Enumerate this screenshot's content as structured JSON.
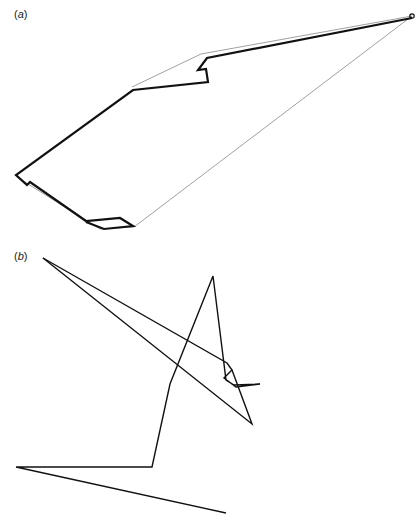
{
  "panels": [
    {
      "id": "a",
      "label_open": "(",
      "label_letter": "a",
      "label_close": ")",
      "thin_path_color": "#888888",
      "thick_path_color": "#111111",
      "thin_path": [
        [
          132,
          87
        ],
        [
          201,
          54
        ],
        [
          412,
          16
        ],
        [
          134,
          227
        ],
        [
          100,
          229
        ],
        [
          28,
          184
        ],
        [
          16,
          176
        ]
      ],
      "thick_path": [
        [
          412,
          18
        ],
        [
          207,
          58
        ],
        [
          198,
          70
        ],
        [
          206,
          69
        ],
        [
          208,
          82
        ],
        [
          133,
          90
        ],
        [
          16,
          175
        ],
        [
          27,
          185
        ],
        [
          30,
          182
        ],
        [
          86,
          221
        ],
        [
          120,
          218
        ],
        [
          133,
          226
        ],
        [
          104,
          229
        ],
        [
          86,
          222
        ]
      ],
      "end_marker": [
        412,
        16
      ]
    },
    {
      "id": "b",
      "label_open": "(",
      "label_letter": "b",
      "label_close": ")",
      "path_color": "#111111",
      "path": [
        [
          43,
          258
        ],
        [
          227,
          363
        ],
        [
          232,
          370
        ],
        [
          224,
          378
        ],
        [
          236,
          387
        ],
        [
          260,
          384
        ],
        [
          234,
          385
        ],
        [
          226,
          380
        ],
        [
          213,
          276
        ],
        [
          170,
          384
        ],
        [
          152,
          467
        ],
        [
          16,
          467
        ],
        [
          226,
          513
        ]
      ],
      "path2": [
        [
          43,
          258
        ],
        [
          252,
          424
        ],
        [
          232,
          370
        ]
      ]
    }
  ]
}
